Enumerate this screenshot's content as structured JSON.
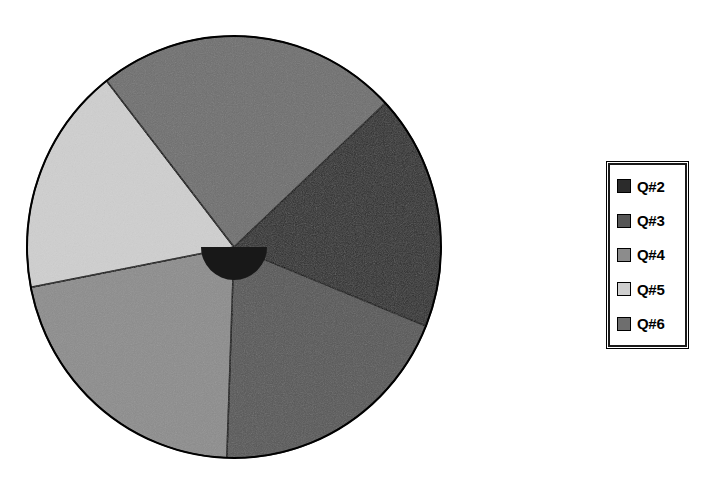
{
  "chart_data": {
    "type": "pie",
    "title": "",
    "subtitle": "",
    "xlabel": "",
    "ylabel": "",
    "grid": false,
    "legend_position": "right",
    "categories": [
      "Q#2",
      "Q#3",
      "Q#4",
      "Q#5",
      "Q#6"
    ],
    "values": [
      18.1,
      19.4,
      21.4,
      17.5,
      23.6
    ],
    "units": "percent",
    "slice_colors": [
      "#2b2b2b",
      "#565656",
      "#8c8c8c",
      "#cfcfcf",
      "#6e6e6e"
    ],
    "slices": [
      {
        "label": "Q#2",
        "value": 18.1,
        "color": "#2b2b2b",
        "start_angle": 47,
        "end_angle": 112
      },
      {
        "label": "Q#3",
        "value": 19.4,
        "color": "#565656",
        "start_angle": 112,
        "end_angle": 182
      },
      {
        "label": "Q#4",
        "value": 21.4,
        "color": "#8c8c8c",
        "start_angle": 182,
        "end_angle": 259
      },
      {
        "label": "Q#5",
        "value": 17.5,
        "color": "#cfcfcf",
        "start_angle": 259,
        "end_angle": 322
      },
      {
        "label": "Q#6",
        "value": 23.6,
        "color": "#6e6e6e",
        "start_angle": 322,
        "end_angle": 407
      }
    ],
    "center_marker": {
      "present": true,
      "shape": "half-disc",
      "color": "#181818",
      "radius": 33
    },
    "geometry": {
      "center_x": 234,
      "center_y": 247,
      "radius_x": 207,
      "radius_y": 211,
      "outline_color": "#000000",
      "outline_width": 2
    }
  },
  "legend": {
    "border_color": "#1a1a1a",
    "background": "#ffffff",
    "items": [
      {
        "label": "Q#2",
        "color": "#2b2b2b"
      },
      {
        "label": "Q#3",
        "color": "#565656"
      },
      {
        "label": "Q#4",
        "color": "#8c8c8c"
      },
      {
        "label": "Q#5",
        "color": "#cfcfcf"
      },
      {
        "label": "Q#6",
        "color": "#6e6e6e"
      }
    ]
  }
}
